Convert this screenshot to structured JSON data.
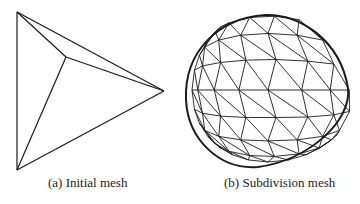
{
  "figures": [
    {
      "id": "a",
      "caption": "(a) Initial mesh",
      "description": "Tetrahedron wireframe",
      "vertices": [
        [
          17,
          12
        ],
        [
          66,
          57
        ],
        [
          164,
          91
        ],
        [
          17,
          170
        ]
      ],
      "edges": [
        [
          0,
          1
        ],
        [
          0,
          2
        ],
        [
          0,
          3
        ],
        [
          1,
          2
        ],
        [
          1,
          3
        ],
        [
          2,
          3
        ]
      ]
    },
    {
      "id": "b",
      "caption": "(b) Subdivision mesh",
      "description": "Subdivided triangular mesh of rounded tetrahedron"
    }
  ],
  "colors": {
    "line": "#1a1a1a",
    "background": "#ffffff",
    "text": "#222222"
  }
}
